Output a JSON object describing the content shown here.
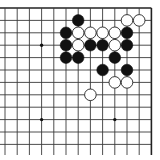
{
  "board": {
    "type": "go-board-fragment",
    "columns": 13,
    "rows": 12,
    "origin_x": 5,
    "origin_y": 8,
    "spacing_x": 12.2,
    "spacing_y": 12.4,
    "line_bottom_extent": 155,
    "top_edge": true,
    "right_edge": true,
    "colors": {
      "line": "#3a3a3a",
      "black_stone": "#111111",
      "white_stone": "#ffffff",
      "background": "#ffffff"
    },
    "star_points": [
      {
        "col": 3,
        "row": 3
      },
      {
        "col": 3,
        "row": 9
      },
      {
        "col": 9,
        "row": 9
      }
    ],
    "stones": [
      {
        "color": "black",
        "col": 6,
        "row": 1
      },
      {
        "color": "white",
        "col": 10,
        "row": 1
      },
      {
        "color": "white",
        "col": 11,
        "row": 1
      },
      {
        "color": "black",
        "col": 5,
        "row": 2
      },
      {
        "color": "white",
        "col": 6,
        "row": 2
      },
      {
        "color": "white",
        "col": 7,
        "row": 2
      },
      {
        "color": "white",
        "col": 8,
        "row": 2
      },
      {
        "color": "white",
        "col": 9,
        "row": 2
      },
      {
        "color": "black",
        "col": 10,
        "row": 2
      },
      {
        "color": "black",
        "col": 5,
        "row": 3
      },
      {
        "color": "white",
        "col": 6,
        "row": 3
      },
      {
        "color": "black",
        "col": 7,
        "row": 3
      },
      {
        "color": "black",
        "col": 8,
        "row": 3
      },
      {
        "color": "white",
        "col": 9,
        "row": 3
      },
      {
        "color": "black",
        "col": 10,
        "row": 3
      },
      {
        "color": "black",
        "col": 5,
        "row": 4
      },
      {
        "color": "black",
        "col": 6,
        "row": 4
      },
      {
        "color": "black",
        "col": 9,
        "row": 4
      },
      {
        "color": "black",
        "col": 8,
        "row": 5
      },
      {
        "color": "black",
        "col": 10,
        "row": 5
      },
      {
        "color": "white",
        "col": 9,
        "row": 6
      },
      {
        "color": "white",
        "col": 10,
        "row": 6
      },
      {
        "color": "white",
        "col": 7,
        "row": 7
      }
    ]
  }
}
